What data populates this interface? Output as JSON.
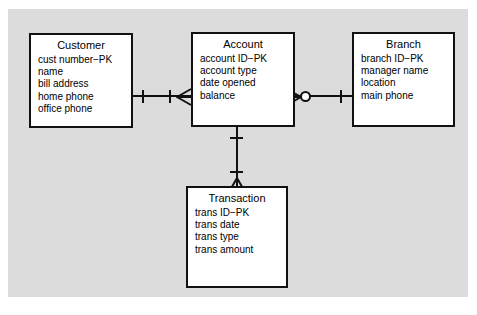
{
  "diagram": {
    "type": "entity-relationship-diagram",
    "notation": "crows-foot",
    "canvas_color": "#dcdcdc",
    "page_color": "#ffffff",
    "line_color": "#111111",
    "entity_fill": "#ffffff",
    "entities": [
      {
        "id": "customer",
        "title": "Customer",
        "attributes": [
          "cust number−PK",
          "name",
          "bill address",
          "home phone",
          "office phone"
        ]
      },
      {
        "id": "account",
        "title": "Account",
        "attributes": [
          "account ID−PK",
          "account type",
          "date opened",
          "balance"
        ]
      },
      {
        "id": "branch",
        "title": "Branch",
        "attributes": [
          "branch ID−PK",
          "manager name",
          "location",
          "main phone"
        ]
      },
      {
        "id": "transaction",
        "title": "Transaction",
        "attributes": [
          "trans ID−PK",
          "trans date",
          "trans type",
          "trans amount"
        ]
      }
    ],
    "relationships": [
      {
        "id": "customer-account",
        "from": "customer",
        "to": "account",
        "from_cardinality": "one",
        "to_cardinality": "one-to-many",
        "orientation": "horizontal"
      },
      {
        "id": "account-branch",
        "from": "account",
        "to": "branch",
        "from_cardinality": "zero-or-many",
        "to_cardinality": "one",
        "orientation": "horizontal"
      },
      {
        "id": "account-transaction",
        "from": "account",
        "to": "transaction",
        "from_cardinality": "one",
        "to_cardinality": "one-to-many",
        "orientation": "vertical"
      }
    ]
  }
}
